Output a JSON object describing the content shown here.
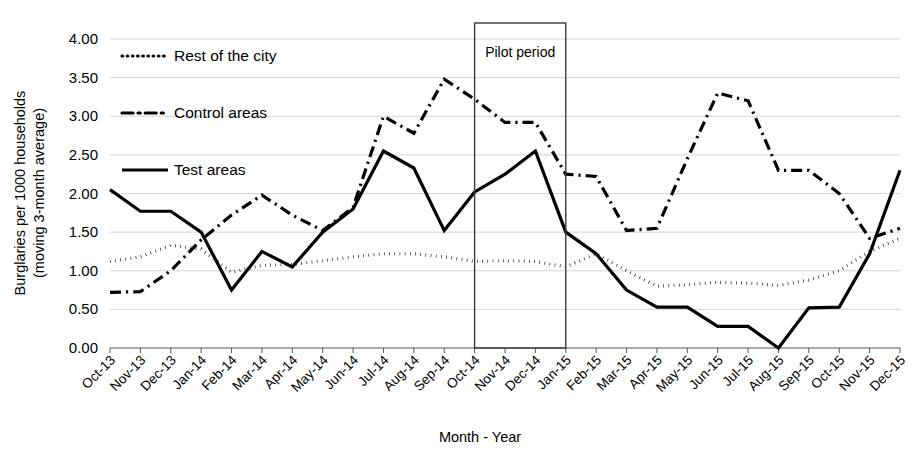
{
  "chart_data": {
    "type": "line",
    "title": "",
    "xlabel": "Month - Year",
    "ylabel": "Burglaries per 1000 households (moving 3-month average)",
    "ylabel_line1": "Burglaries per 1000 households",
    "ylabel_line2": "(moving 3-month average)",
    "ylim": [
      0,
      4
    ],
    "ytick_labels": [
      "0.00",
      "0.50",
      "1.00",
      "1.50",
      "2.00",
      "2.50",
      "3.00",
      "3.50",
      "4.00"
    ],
    "ytick_values": [
      0,
      0.5,
      1,
      1.5,
      2,
      2.5,
      3,
      3.5,
      4
    ],
    "grid": true,
    "legend_position": "upper-left-inside",
    "categories": [
      "Oct-13",
      "Nov-13",
      "Dec-13",
      "Jan-14",
      "Feb-14",
      "Mar-14",
      "Apr-14",
      "May-14",
      "Jun-14",
      "Jul-14",
      "Aug-14",
      "Sep-14",
      "Oct-14",
      "Nov-14",
      "Dec-14",
      "Jan-15",
      "Feb-15",
      "Mar-15",
      "Apr-15",
      "May-15",
      "Jun-15",
      "Jul-15",
      "Aug-15",
      "Sep-15",
      "Oct-15",
      "Nov-15",
      "Dec-15"
    ],
    "series": [
      {
        "name": "Rest of the city",
        "style": "dotted",
        "color": "#000000",
        "values": [
          1.12,
          1.18,
          1.33,
          1.28,
          0.98,
          1.07,
          1.08,
          1.13,
          1.18,
          1.22,
          1.22,
          1.18,
          1.12,
          1.13,
          1.12,
          1.05,
          1.22,
          1.0,
          0.8,
          0.82,
          0.85,
          0.84,
          0.81,
          0.88,
          1.0,
          1.25,
          1.42
        ]
      },
      {
        "name": "Control areas",
        "style": "dash-dot",
        "color": "#000000",
        "values": [
          0.72,
          0.73,
          1.0,
          1.4,
          1.72,
          1.98,
          1.72,
          1.52,
          1.82,
          3.0,
          2.78,
          3.48,
          3.22,
          2.92,
          2.92,
          2.25,
          2.22,
          1.52,
          1.55,
          2.45,
          3.3,
          3.2,
          2.3,
          2.3,
          2.0,
          1.42,
          1.55
        ]
      },
      {
        "name": "Test areas",
        "style": "solid",
        "color": "#000000",
        "values": [
          2.05,
          1.77,
          1.77,
          1.5,
          0.75,
          1.25,
          1.05,
          1.5,
          1.8,
          2.55,
          2.33,
          1.52,
          2.02,
          2.25,
          2.55,
          1.5,
          1.22,
          0.75,
          0.53,
          0.53,
          0.28,
          0.28,
          0.0,
          0.52,
          0.53,
          1.22,
          2.3
        ]
      }
    ],
    "annotations": [
      {
        "label": "Pilot period",
        "type": "box",
        "start_category": "Oct-14",
        "end_category": "Jan-15"
      }
    ]
  }
}
